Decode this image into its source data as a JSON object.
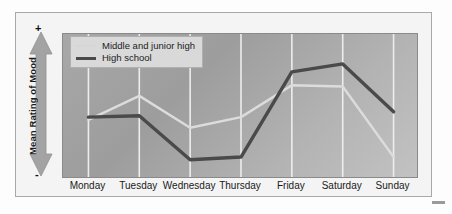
{
  "chart_data": {
    "type": "line",
    "title": "",
    "xlabel": "",
    "ylabel": "Mean Rating of Mood",
    "categories": [
      "Monday",
      "Tuesday",
      "Wednesday",
      "Thursday",
      "Friday",
      "Saturday",
      "Sunday"
    ],
    "series": [
      {
        "name": "Middle and junior high",
        "color": "#dcdcdc",
        "values": [
          0.4,
          0.58,
          0.34,
          0.42,
          0.66,
          0.65,
          0.12
        ]
      },
      {
        "name": "High school",
        "color": "#4a4a4a",
        "values": [
          0.42,
          0.43,
          0.1,
          0.12,
          0.76,
          0.82,
          0.46
        ]
      }
    ],
    "ylim": [
      0,
      1
    ],
    "y_axis_min_tick": "-",
    "y_axis_max_tick": "+",
    "grid": true,
    "grid_orientation": "vertical",
    "legend_position": "top-left",
    "axis_note": "Y axis is an unlabeled bipolar scale running from - (low) at bottom to + (high) at top"
  },
  "axis": {
    "y_title": "Mean Rating of Mood",
    "y_plus": "+",
    "y_minus": "-"
  },
  "legend": {
    "items": [
      {
        "label": "Middle and junior high"
      },
      {
        "label": "High school"
      }
    ]
  },
  "icons": {
    "y_axis_arrow": "double-headed-vertical-arrow-icon"
  },
  "colors": {
    "plot_background_light": "#c2c2c2",
    "plot_background_dark": "#a0a0a0",
    "gridline": "#ededed",
    "series_light": "#dcdcdc",
    "series_dark": "#4a4a4a",
    "legend_background": "#d9d9d9",
    "frame_border": "#a9a9a9",
    "arrow_fill": "#a3a3a3"
  }
}
